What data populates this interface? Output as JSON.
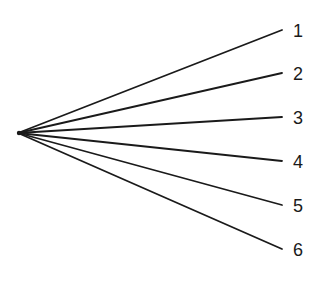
{
  "diagram": {
    "type": "fan",
    "origin": {
      "x": 18,
      "y": 133
    },
    "line_color": "#1a1a1a",
    "line_width": 1.8,
    "branches": [
      {
        "label": "1",
        "end": {
          "x": 282,
          "y": 30
        }
      },
      {
        "label": "2",
        "end": {
          "x": 282,
          "y": 73
        }
      },
      {
        "label": "3",
        "end": {
          "x": 282,
          "y": 117
        }
      },
      {
        "label": "4",
        "end": {
          "x": 282,
          "y": 161
        }
      },
      {
        "label": "5",
        "end": {
          "x": 282,
          "y": 205
        }
      },
      {
        "label": "6",
        "end": {
          "x": 282,
          "y": 249
        }
      }
    ],
    "label_x": 293
  }
}
